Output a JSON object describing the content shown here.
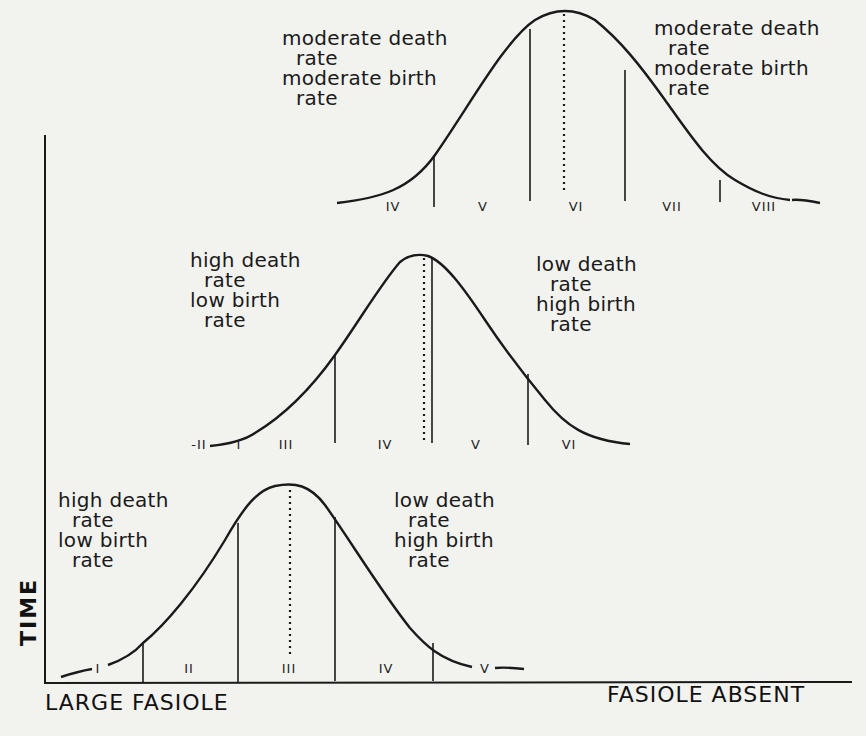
{
  "diagram": {
    "axes": {
      "y_label": "TIME",
      "x_label_left": "LARGE FASIOLE",
      "x_label_right": "FASIOLE ABSENT"
    },
    "curves": [
      {
        "id": "top",
        "left_annotation": [
          "moderate death",
          "rate",
          "moderate birth",
          "rate"
        ],
        "right_annotation": [
          "moderate death",
          "rate",
          "moderate birth",
          "rate"
        ],
        "stages": [
          "IV",
          "V",
          "VI",
          "VII",
          "VIII"
        ]
      },
      {
        "id": "middle",
        "left_annotation": [
          "high death",
          "rate",
          "low birth",
          "rate"
        ],
        "right_annotation": [
          "low death",
          "rate",
          "high birth",
          "rate"
        ],
        "stages": [
          "-II",
          "I",
          "III",
          "IV",
          "V",
          "VI"
        ]
      },
      {
        "id": "bottom",
        "left_annotation": [
          "high death",
          "rate",
          "low birth",
          "rate"
        ],
        "right_annotation": [
          "low death",
          "rate",
          "high birth",
          "rate"
        ],
        "stages": [
          "I",
          "II",
          "III",
          "IV",
          "V"
        ]
      }
    ],
    "colors": {
      "background": "#f2f2ef",
      "ink": "#1a1a1a"
    }
  }
}
